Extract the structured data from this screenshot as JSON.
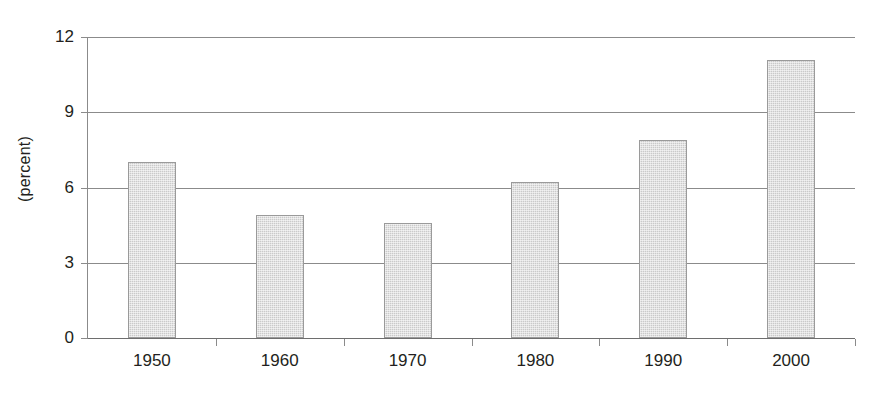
{
  "chart_data": {
    "type": "bar",
    "title": "",
    "subtitle": "",
    "xlabel": "",
    "ylabel": "(percent)",
    "categories": [
      "1950",
      "1960",
      "1970",
      "1980",
      "1990",
      "2000"
    ],
    "values": [
      7.0,
      4.9,
      4.6,
      6.2,
      7.9,
      11.1
    ],
    "series": [
      {
        "name": "percent",
        "values": [
          7.0,
          4.9,
          4.6,
          6.2,
          7.9,
          11.1
        ]
      }
    ],
    "ylim": [
      0,
      12
    ],
    "yticks": [
      0,
      3,
      6,
      9,
      12
    ],
    "ytick_labels": [
      "0",
      "3",
      "6",
      "9",
      "12"
    ],
    "xtick_labels": [
      "1950",
      "1960",
      "1970",
      "1980",
      "1990",
      "2000"
    ],
    "grid": true,
    "grid_axis": "y",
    "legend": false,
    "legend_position": "none",
    "bar_fill_color": "#d2d2d2",
    "bar_border_color": "#9a9a9a",
    "gridline_color": "#8b8b8b",
    "axis_color": "#8b8b8b",
    "text_color": "#231f20",
    "background_color": "#ffffff"
  }
}
